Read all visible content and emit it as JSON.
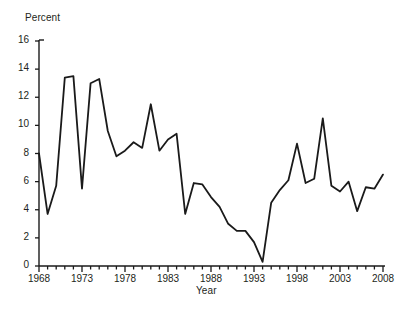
{
  "chart_data": {
    "type": "line",
    "title": "",
    "xlabel": "Year",
    "ylabel": "Percent",
    "xlim": [
      1968,
      2008
    ],
    "ylim": [
      0,
      16
    ],
    "grid": false,
    "legend": null,
    "x_tick_labels": [
      "1968",
      "1973",
      "1978",
      "1983",
      "1988",
      "1993",
      "1998",
      "2003",
      "2008"
    ],
    "x_tick_values": [
      1968,
      1973,
      1978,
      1983,
      1988,
      1993,
      1998,
      2003,
      2008
    ],
    "x_minor_tick_step": 1,
    "y_tick_labels": [
      "0",
      "2",
      "4",
      "6",
      "8",
      "10",
      "12",
      "14",
      "16"
    ],
    "y_tick_values": [
      0,
      2,
      4,
      6,
      8,
      10,
      12,
      14,
      16
    ],
    "line_color": "#1a1a1a",
    "line_width": 1.8,
    "x": [
      1968,
      1969,
      1970,
      1971,
      1972,
      1973,
      1974,
      1975,
      1976,
      1977,
      1978,
      1979,
      1980,
      1981,
      1982,
      1983,
      1984,
      1985,
      1986,
      1987,
      1988,
      1989,
      1990,
      1991,
      1992,
      1993,
      1994,
      1995,
      1996,
      1997,
      1998,
      1999,
      2000,
      2001,
      2002,
      2003,
      2004,
      2005,
      2006,
      2007,
      2008
    ],
    "values": [
      8.0,
      3.7,
      5.7,
      13.4,
      13.5,
      5.5,
      13.0,
      13.3,
      9.6,
      7.8,
      8.2,
      8.8,
      8.4,
      11.5,
      8.2,
      9.0,
      9.4,
      3.7,
      5.9,
      5.8,
      4.9,
      4.2,
      3.0,
      2.5,
      2.5,
      1.7,
      0.3,
      4.5,
      5.4,
      6.1,
      8.7,
      5.9,
      6.2,
      10.5,
      5.7,
      5.3,
      6.0,
      3.9,
      5.6,
      5.5,
      6.5
    ],
    "series": [
      {
        "name": "Percent",
        "values": [
          8.0,
          3.7,
          5.7,
          13.4,
          13.5,
          5.5,
          13.0,
          13.3,
          9.6,
          7.8,
          8.2,
          8.8,
          8.4,
          11.5,
          8.2,
          9.0,
          9.4,
          3.7,
          5.9,
          5.8,
          4.9,
          4.2,
          3.0,
          2.5,
          2.5,
          1.7,
          0.3,
          4.5,
          5.4,
          6.1,
          8.7,
          5.9,
          6.2,
          10.5,
          5.7,
          5.3,
          6.0,
          3.9,
          5.6,
          5.5,
          6.5
        ]
      }
    ]
  }
}
